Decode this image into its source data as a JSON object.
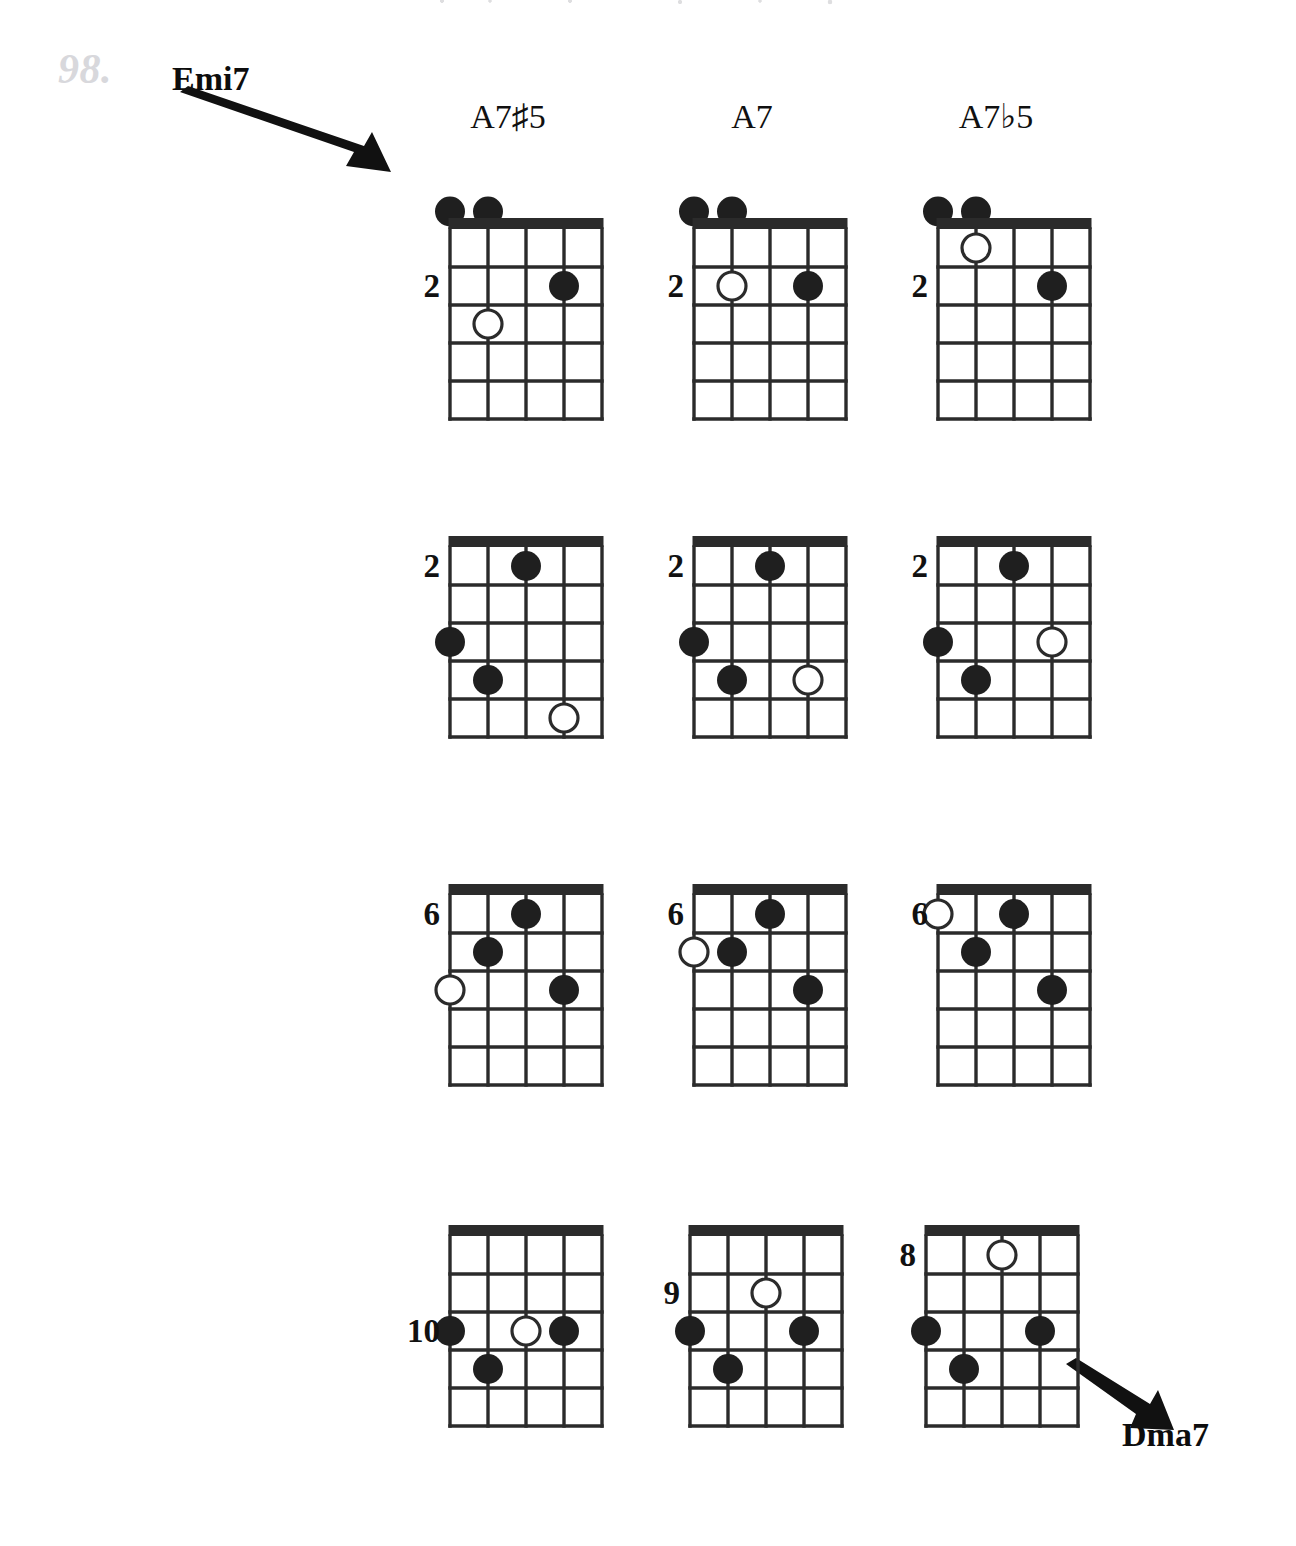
{
  "page": {
    "number": "98.",
    "width": 1296,
    "height": 1546,
    "background": "#ffffff",
    "ink_color": "#111111",
    "page_number_color": "#d8d8dc"
  },
  "callouts": [
    {
      "id": "emi7",
      "label": "Emi7",
      "arrow_direction": "down-right",
      "points_to": "row1-col1-diagram"
    },
    {
      "id": "dma7",
      "label": "Dma7",
      "arrow_direction": "down-right",
      "points_from": "row4-col3-diagram"
    }
  ],
  "columns": [
    {
      "id": "col1",
      "label": "A7♯5",
      "center_x": 508
    },
    {
      "id": "col2",
      "label": "A7",
      "center_x": 752
    },
    {
      "id": "col3",
      "label": "A7♭5",
      "center_x": 996
    }
  ],
  "diagram_geometry": {
    "strings": 5,
    "frets": 5,
    "string_spacing": 38,
    "fret_spacing": 38,
    "nut_thickness": 11,
    "grid_width": 152,
    "grid_height": 190,
    "dot_radius": 15,
    "open_dot_radius": 14,
    "line_color": "#2b2b2b",
    "dot_fill": "#1f1f1f",
    "open_dot_fill": "#ffffff"
  },
  "chart_data": {
    "type": "table",
    "notation": {
      "filled_dot": "fretted note",
      "open_dot": "optional / alternate note (hollow circle)",
      "dot_above_nut": "open string",
      "left_number": "starting fret position"
    },
    "string_axis": "1 = leftmost line, 5 = rightmost line",
    "fret_axis": "1 = space just below the nut/top bar",
    "rows": [
      {
        "row": 1,
        "has_nut": true,
        "diagrams": [
          {
            "chord": "A7♯5",
            "fret_marker": "2",
            "fret_marker_at_fret": 2,
            "open_strings": [
              1,
              2
            ],
            "notes": [
              {
                "string": 4,
                "fret": 2,
                "type": "filled"
              },
              {
                "string": 2,
                "fret": 3,
                "type": "open"
              }
            ]
          },
          {
            "chord": "A7",
            "fret_marker": "2",
            "fret_marker_at_fret": 2,
            "open_strings": [
              1,
              2
            ],
            "notes": [
              {
                "string": 2,
                "fret": 2,
                "type": "open"
              },
              {
                "string": 4,
                "fret": 2,
                "type": "filled"
              }
            ]
          },
          {
            "chord": "A7♭5",
            "fret_marker": "2",
            "fret_marker_at_fret": 2,
            "open_strings": [
              1,
              2
            ],
            "notes": [
              {
                "string": 2,
                "fret": 1,
                "type": "open"
              },
              {
                "string": 4,
                "fret": 2,
                "type": "filled"
              }
            ]
          }
        ]
      },
      {
        "row": 2,
        "has_nut": false,
        "diagrams": [
          {
            "chord": "A7♯5",
            "fret_marker": "2",
            "fret_marker_at_fret": 1,
            "open_strings": [],
            "notes": [
              {
                "string": 3,
                "fret": 1,
                "type": "filled"
              },
              {
                "string": 1,
                "fret": 3,
                "type": "filled"
              },
              {
                "string": 2,
                "fret": 4,
                "type": "filled"
              },
              {
                "string": 4,
                "fret": 5,
                "type": "open"
              }
            ]
          },
          {
            "chord": "A7",
            "fret_marker": "2",
            "fret_marker_at_fret": 1,
            "open_strings": [],
            "notes": [
              {
                "string": 3,
                "fret": 1,
                "type": "filled"
              },
              {
                "string": 1,
                "fret": 3,
                "type": "filled"
              },
              {
                "string": 2,
                "fret": 4,
                "type": "filled"
              },
              {
                "string": 4,
                "fret": 4,
                "type": "open"
              }
            ]
          },
          {
            "chord": "A7♭5",
            "fret_marker": "2",
            "fret_marker_at_fret": 1,
            "open_strings": [],
            "notes": [
              {
                "string": 3,
                "fret": 1,
                "type": "filled"
              },
              {
                "string": 1,
                "fret": 3,
                "type": "filled"
              },
              {
                "string": 4,
                "fret": 3,
                "type": "open"
              },
              {
                "string": 2,
                "fret": 4,
                "type": "filled"
              }
            ]
          }
        ]
      },
      {
        "row": 3,
        "has_nut": false,
        "diagrams": [
          {
            "chord": "A7♯5",
            "fret_marker": "6",
            "fret_marker_at_fret": 1,
            "open_strings": [],
            "notes": [
              {
                "string": 3,
                "fret": 1,
                "type": "filled"
              },
              {
                "string": 2,
                "fret": 2,
                "type": "filled"
              },
              {
                "string": 1,
                "fret": 3,
                "type": "open"
              },
              {
                "string": 4,
                "fret": 3,
                "type": "filled"
              }
            ]
          },
          {
            "chord": "A7",
            "fret_marker": "6",
            "fret_marker_at_fret": 1,
            "open_strings": [],
            "notes": [
              {
                "string": 3,
                "fret": 1,
                "type": "filled"
              },
              {
                "string": 1,
                "fret": 2,
                "type": "open"
              },
              {
                "string": 2,
                "fret": 2,
                "type": "filled"
              },
              {
                "string": 4,
                "fret": 3,
                "type": "filled"
              }
            ]
          },
          {
            "chord": "A7♭5",
            "fret_marker": "6",
            "fret_marker_at_fret": 1,
            "open_strings": [],
            "notes": [
              {
                "string": 1,
                "fret": 1,
                "type": "open"
              },
              {
                "string": 3,
                "fret": 1,
                "type": "filled"
              },
              {
                "string": 2,
                "fret": 2,
                "type": "filled"
              },
              {
                "string": 4,
                "fret": 3,
                "type": "filled"
              }
            ]
          }
        ]
      },
      {
        "row": 4,
        "has_nut": false,
        "diagrams": [
          {
            "chord": "A7♯5",
            "fret_marker": "10",
            "fret_marker_at_fret": 3,
            "open_strings": [],
            "notes": [
              {
                "string": 1,
                "fret": 3,
                "type": "filled"
              },
              {
                "string": 3,
                "fret": 3,
                "type": "open"
              },
              {
                "string": 4,
                "fret": 3,
                "type": "filled"
              },
              {
                "string": 2,
                "fret": 4,
                "type": "filled"
              }
            ]
          },
          {
            "chord": "A7",
            "fret_marker": "9",
            "fret_marker_at_fret": 2,
            "open_strings": [],
            "notes": [
              {
                "string": 3,
                "fret": 2,
                "type": "open"
              },
              {
                "string": 1,
                "fret": 3,
                "type": "filled"
              },
              {
                "string": 4,
                "fret": 3,
                "type": "filled"
              },
              {
                "string": 2,
                "fret": 4,
                "type": "filled"
              }
            ]
          },
          {
            "chord": "A7♭5",
            "fret_marker": "8",
            "fret_marker_at_fret": 1,
            "open_strings": [],
            "notes": [
              {
                "string": 3,
                "fret": 1,
                "type": "open"
              },
              {
                "string": 1,
                "fret": 3,
                "type": "filled"
              },
              {
                "string": 4,
                "fret": 3,
                "type": "filled"
              },
              {
                "string": 2,
                "fret": 4,
                "type": "filled"
              }
            ]
          }
        ]
      }
    ]
  },
  "layout": {
    "column_x": [
      432,
      676,
      920
    ],
    "header_y": 100,
    "row_y": [
      185,
      533,
      881,
      1222
    ],
    "row4_x": [
      432,
      672,
      908
    ]
  }
}
